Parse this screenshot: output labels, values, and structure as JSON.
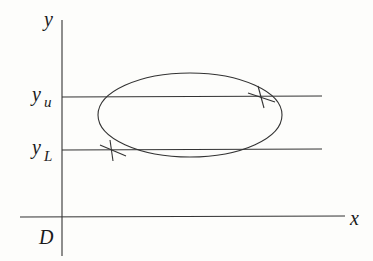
{
  "diagram": {
    "type": "ellipse-region-between-lines",
    "axes": {
      "x_label": "x",
      "y_label": "y",
      "region_label": "D"
    },
    "levels": [
      {
        "id": "upper",
        "base": "y",
        "subscript": "u"
      },
      {
        "id": "lower",
        "base": "y",
        "subscript": "L"
      }
    ],
    "shapes": {
      "closed_curve": "ellipse",
      "tangent_points": [
        "upper-right intersection with y_u",
        "lower-left intersection with y_L"
      ]
    },
    "colors": {
      "ink": "#333333",
      "background": "#fdfdfb"
    }
  }
}
